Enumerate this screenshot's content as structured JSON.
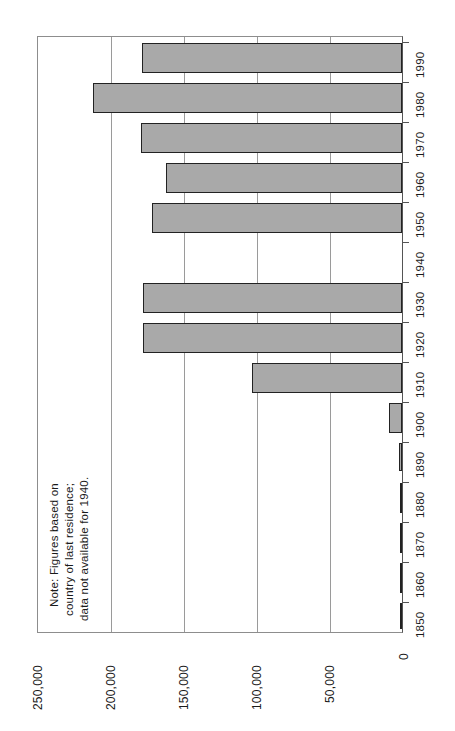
{
  "chart_data": {
    "type": "bar",
    "orientation": "horizontal",
    "title": "",
    "subtitle": "",
    "xlabel": "",
    "ylabel": "",
    "categories": [
      "1850",
      "1860",
      "1870",
      "1880",
      "1890",
      "1900",
      "1910",
      "1920",
      "1930",
      "1940",
      "1950",
      "1960",
      "1970",
      "1980",
      "1990"
    ],
    "values": [
      300,
      400,
      600,
      900,
      2000,
      8900,
      102300,
      177200,
      177200,
      0,
      171000,
      161400,
      178400,
      210900,
      177900
    ],
    "value_ticks": [
      "250,000",
      "200,000",
      "150,000",
      "100,000",
      "50,000",
      "0"
    ],
    "value_tick_numbers": [
      250000,
      200000,
      150000,
      100000,
      50000,
      0
    ],
    "xlim": [
      0,
      250000
    ],
    "grid": true,
    "legend": "none",
    "annotations": [
      "Note: Figures based on",
      "country of last residence;",
      "data not available for 1940."
    ],
    "missing_data_category": "1940",
    "colors": {
      "bar_fill": "#a9a9a9",
      "bar_border": "#222222",
      "gridline": "#9a9a9a",
      "axis": "#555555",
      "text": "#1a1a1a",
      "background": "#ffffff"
    }
  },
  "note": {
    "line1": "Note: Figures based on",
    "line2": "country of last residence;",
    "line3": "data not available for 1940."
  },
  "value_axis": {
    "tick_250k": "250,000",
    "tick_200k": "200,000",
    "tick_150k": "150,000",
    "tick_100k": "100,000",
    "tick_50k": "50,000",
    "tick_0": "0"
  },
  "category_axis": {
    "y1850": "1850",
    "y1860": "1860",
    "y1870": "1870",
    "y1880": "1880",
    "y1890": "1890",
    "y1900": "1900",
    "y1910": "1910",
    "y1920": "1920",
    "y1930": "1930",
    "y1940": "1940",
    "y1950": "1950",
    "y1960": "1960",
    "y1970": "1970",
    "y1980": "1980",
    "y1990": "1990"
  }
}
